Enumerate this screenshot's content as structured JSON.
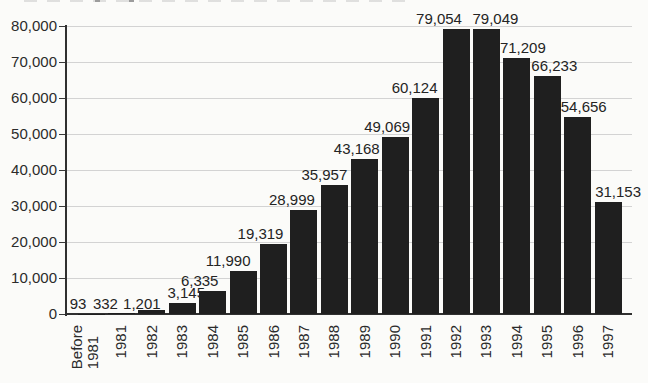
{
  "chart_data": {
    "type": "bar",
    "title": "",
    "xlabel": "",
    "ylabel": "",
    "categories": [
      "Before\n1981",
      "1981",
      "1982",
      "1983",
      "1984",
      "1985",
      "1986",
      "1987",
      "1988",
      "1989",
      "1990",
      "1991",
      "1992",
      "1993",
      "1994",
      "1995",
      "1996",
      "1997"
    ],
    "values": [
      93,
      332,
      1201,
      3145,
      6335,
      11990,
      19319,
      28999,
      35957,
      43168,
      49069,
      60124,
      79054,
      79049,
      71209,
      66233,
      54656,
      31153
    ],
    "value_labels": [
      "93",
      "332",
      "1,201",
      "3,145",
      "6,335",
      "11,990",
      "19,319",
      "28,999",
      "35,957",
      "43,168",
      "49,069",
      "60,124",
      "79,054",
      "79,049",
      "71,209",
      "66,233",
      "54,656",
      "31,153"
    ],
    "ylim": [
      0,
      80000
    ],
    "ytick_step": 10000,
    "ytick_labels": [
      "0",
      "10,000",
      "20,000",
      "30,000",
      "40,000",
      "50,000",
      "60,000",
      "70,000",
      "80,000"
    ],
    "grid": "horizontal",
    "legend": false,
    "colors": {
      "bar": "#1f1f1f",
      "gridline": "#d3d3d3",
      "axis": "#303030",
      "text": "#262626",
      "background": "#fbfbf9"
    }
  }
}
